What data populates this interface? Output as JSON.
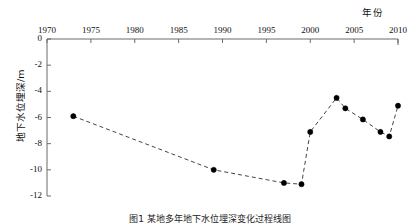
{
  "figure": {
    "caption": "图1  某地多年地下水位埋深变化过程线图"
  },
  "axes": {
    "x_axis_title": "年份",
    "y_axis_title": "地下水位埋深/m",
    "x_ticks": [
      "1970",
      "1975",
      "1980",
      "1985",
      "1990",
      "1995",
      "2000",
      "2005",
      "2010"
    ],
    "y_ticks": [
      "0",
      "-2",
      "-4",
      "-6",
      "-8",
      "-10",
      "-12"
    ],
    "x_position": "top",
    "y_position": "left"
  },
  "style": {
    "line_color": "#444444",
    "marker_color": "#000000",
    "axis_color": "#6b6b6b",
    "background": "#ffffff",
    "line_dash": "dashed"
  },
  "chart_data": {
    "type": "line",
    "title": "",
    "subtitle": "",
    "xlabel": "年份",
    "ylabel": "地下水位埋深/m",
    "xlim": [
      1970,
      2010
    ],
    "ylim": [
      -12,
      0
    ],
    "xticks": [
      1970,
      1975,
      1980,
      1985,
      1990,
      1995,
      2000,
      2005,
      2010
    ],
    "yticks": [
      0,
      -2,
      -4,
      -6,
      -8,
      -10,
      -12
    ],
    "grid": false,
    "legend": null,
    "x_axis_side": "top",
    "marker": "filled-circle",
    "linestyle": "dashed",
    "series": [
      {
        "name": "地下水位埋深",
        "x": [
          1973,
          1989,
          1997,
          1999,
          2000,
          2003,
          2004,
          2006,
          2008,
          2009,
          2010
        ],
        "values": [
          -5.9,
          -10.0,
          -11.0,
          -11.1,
          -7.1,
          -4.5,
          -5.3,
          -6.15,
          -7.1,
          -7.45,
          -5.1
        ]
      }
    ]
  }
}
